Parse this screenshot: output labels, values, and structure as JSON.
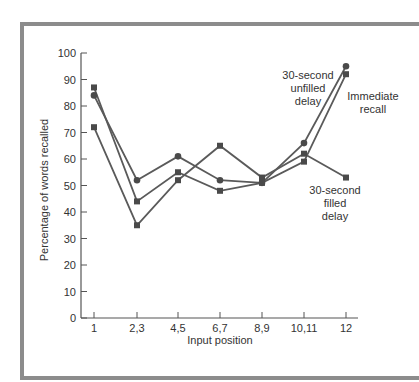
{
  "chart_data": {
    "type": "line",
    "title": "",
    "xlabel": "Input position",
    "ylabel": "Percentage of words recalled",
    "categories": [
      "1",
      "2,3",
      "4,5",
      "6,7",
      "8,9",
      "10,11",
      "12"
    ],
    "yticks": [
      0,
      10,
      20,
      30,
      40,
      50,
      60,
      70,
      80,
      90,
      100
    ],
    "ylim": [
      0,
      100
    ],
    "grid": false,
    "legend": "inline annotations",
    "series": [
      {
        "name": "30-second unfilled delay",
        "marker": "circle",
        "values": [
          84,
          52,
          61,
          52,
          51,
          66,
          95
        ]
      },
      {
        "name": "Immediate recall",
        "marker": "square",
        "values": [
          87,
          44,
          55,
          48,
          51,
          59,
          92
        ]
      },
      {
        "name": "30-second filled delay",
        "marker": "square",
        "values": [
          72,
          35,
          52,
          65,
          53,
          62,
          53
        ]
      }
    ],
    "annotations": [
      {
        "lines": [
          "30-second",
          "unfilled",
          "delay"
        ],
        "series": "30-second unfilled delay"
      },
      {
        "lines": [
          "Immediate",
          "recall"
        ],
        "series": "Immediate recall"
      },
      {
        "lines": [
          "30-second",
          "filled",
          "delay"
        ],
        "series": "30-second filled delay"
      }
    ],
    "colors": {
      "line": "#5a5a5a",
      "marker": "#4a4a4a",
      "axis": "#555555",
      "frame": "#8c8c8c"
    }
  }
}
